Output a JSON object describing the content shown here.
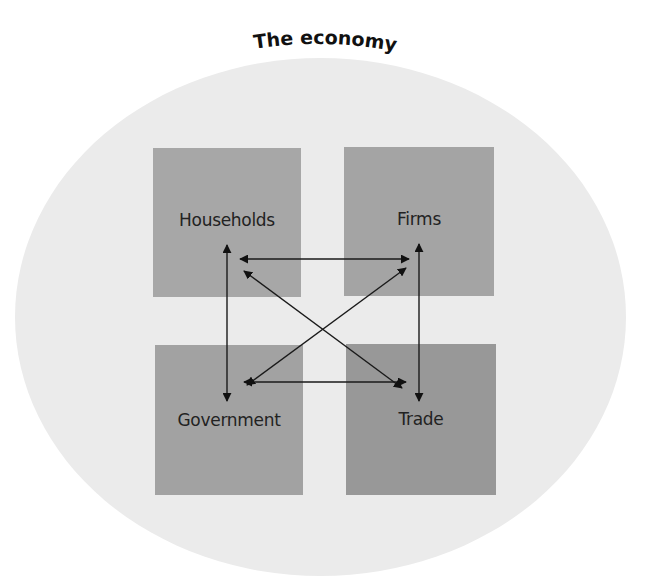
{
  "title": "The economy",
  "sectors": {
    "households": {
      "label": "Households",
      "color": "#a7a7a7"
    },
    "firms": {
      "label": "Firms",
      "color": "#a4a4a4"
    },
    "government": {
      "label": "Government",
      "color": "#a2a2a2"
    },
    "trade": {
      "label": "Trade",
      "color": "#989898"
    }
  },
  "background_color": "#ebebeb",
  "connections": [
    {
      "from": "Households",
      "to": "Firms",
      "type": "two-way"
    },
    {
      "from": "Households",
      "to": "Government",
      "type": "two-way"
    },
    {
      "from": "Firms",
      "to": "Trade",
      "type": "two-way"
    },
    {
      "from": "Government",
      "to": "Trade",
      "type": "two-way"
    },
    {
      "from": "Households",
      "to": "Trade",
      "type": "two-way"
    },
    {
      "from": "Firms",
      "to": "Government",
      "type": "two-way"
    }
  ]
}
